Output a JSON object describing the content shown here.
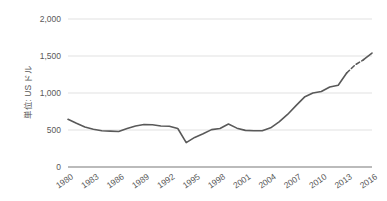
{
  "chart_data": {
    "type": "line",
    "title": "",
    "subtitle": "",
    "xlabel": "",
    "ylabel": "単位: US ドル",
    "ylim": [
      0,
      2000
    ],
    "ytick_labels": [
      "0",
      "500",
      "1,000",
      "1,500",
      "2,000"
    ],
    "ytick_values": [
      0,
      500,
      1000,
      1500,
      2000
    ],
    "xtick_labels": [
      "1980",
      "1983",
      "1986",
      "1989",
      "1992",
      "1995",
      "1998",
      "2001",
      "2004",
      "2007",
      "2010",
      "2013",
      "2016"
    ],
    "xtick_values": [
      1980,
      1983,
      1986,
      1989,
      1992,
      1995,
      1998,
      2001,
      2004,
      2007,
      2010,
      2013,
      2016
    ],
    "xlim": [
      1980,
      2016
    ],
    "grid": "horizontal",
    "legend": "none",
    "line_color": "#595959",
    "grid_color": "#d9d9d9",
    "axis_color": "#868686",
    "x": [
      1980,
      1981,
      1982,
      1983,
      1984,
      1985,
      1986,
      1987,
      1988,
      1989,
      1990,
      1991,
      1992,
      1993,
      1994,
      1995,
      1996,
      1997,
      1998,
      1999,
      2000,
      2001,
      2002,
      2003,
      2004,
      2005,
      2006,
      2007,
      2008,
      2009,
      2010,
      2011,
      2012,
      2013,
      2014,
      2015,
      2016
    ],
    "values": [
      645,
      590,
      540,
      510,
      490,
      485,
      480,
      520,
      555,
      575,
      570,
      555,
      550,
      520,
      330,
      400,
      450,
      505,
      520,
      580,
      525,
      495,
      490,
      490,
      530,
      610,
      710,
      830,
      945,
      1000,
      1020,
      1080,
      1105,
      1270,
      1380,
      1450,
      1540
    ],
    "dashed_segment": {
      "from_index": 33,
      "to_index": 35,
      "note": "forecast/estimate segment drawn dashed"
    }
  }
}
